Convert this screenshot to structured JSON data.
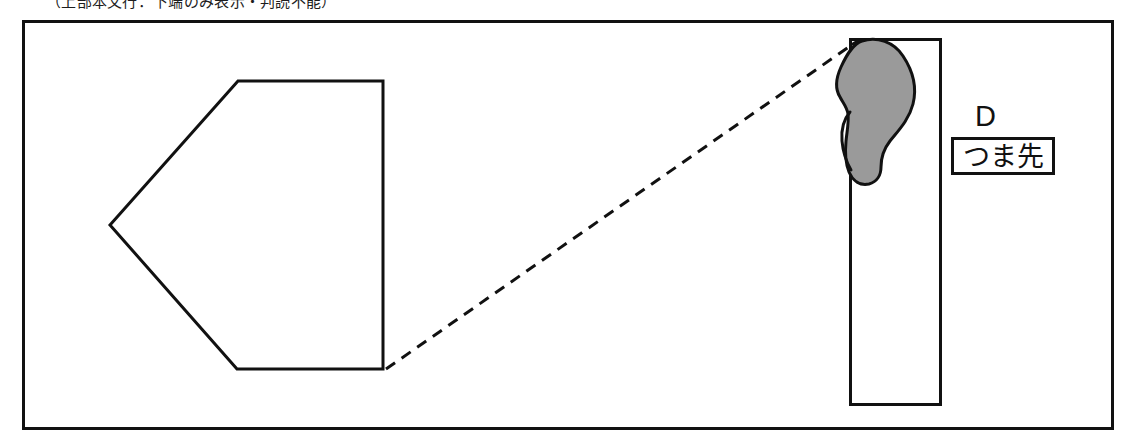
{
  "page": {
    "width": 1134,
    "height": 445,
    "background": "#ffffff",
    "truncated_caption": "（上部本文行：下端のみ表示・判読不能）"
  },
  "figure": {
    "name": "shoe-sole-toe-region-diagram",
    "frame": {
      "x": 22,
      "y": 20,
      "width": 1092,
      "height": 410,
      "stroke": "#111111",
      "stroke_width": 3,
      "fill": "#ffffff"
    },
    "pentagon": {
      "description": "left-pointing pentagon (enlarged detail outline)",
      "points": "238,81 383,81 383,369 237,369 110,225",
      "stroke": "#111111",
      "stroke_width": 3,
      "fill": "#ffffff"
    },
    "rectangle": {
      "description": "vertical rectangle containing the footprint",
      "x": 849,
      "y": 38,
      "width": 92,
      "height": 368,
      "stroke": "#111111",
      "stroke_width": 3,
      "fill": "#ffffff"
    },
    "footprint": {
      "description": "shaded shoe sole / footprint silhouette at top of rectangle",
      "fill": "#9a9a9a",
      "stroke": "#111111",
      "stroke_width": 3,
      "path": "M 861,41 C 876,36 893,41 902,54 C 912,68 916,85 913,101 C 910,117 899,129 890,139 C 883,147 880,156 880,165 C 880,173 878,180 871,183 C 863,186 855,182 851,174 C 847,165 846,154 847,144 C 848,133 850,123 849,113 C 848,107 844,104 841,99 C 836,92 836,82 840,71 C 845,58 852,45 861,41 Z",
      "notch_path": "M 849,112 C 844,118 841,128 842,140 C 843,152 847,162 851,168"
    },
    "leader_line": {
      "description": "dashed leader connecting pentagon corner to footprint",
      "x1": 386,
      "y1": 369,
      "x2": 853,
      "y2": 44,
      "stroke": "#111111",
      "stroke_width": 3,
      "dash": "11 8"
    }
  },
  "annotations": {
    "letter_label": "D",
    "boxed_label": "つま先"
  }
}
